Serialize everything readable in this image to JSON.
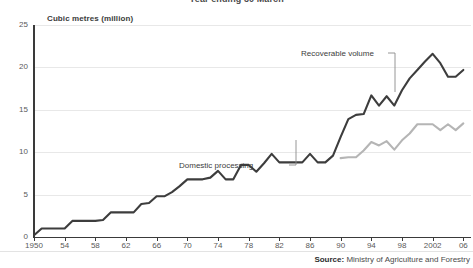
{
  "chart_data": {
    "type": "line",
    "title": "Year ending 30 March",
    "ylabel": "Cubic metres (million)",
    "xlabel": "",
    "ylim": [
      0,
      25
    ],
    "xlim": [
      1950,
      2007
    ],
    "yticks": [
      0,
      5,
      10,
      15,
      20,
      25
    ],
    "ytick_labels": [
      "0",
      "5",
      "10",
      "15",
      "20",
      "25"
    ],
    "xticks": [
      1950,
      1954,
      1958,
      1962,
      1966,
      1970,
      1974,
      1978,
      1982,
      1986,
      1990,
      1994,
      1998,
      2002,
      2006
    ],
    "xtick_labels": [
      "1950",
      "54",
      "58",
      "62",
      "66",
      "70",
      "74",
      "78",
      "82",
      "86",
      "90",
      "94",
      "98",
      "2002",
      "06"
    ],
    "grid": "horizontal",
    "legend_position": "inline-annotations",
    "series": [
      {
        "name": "Recoverable volume",
        "color": "#3d3d3d",
        "x": [
          1950,
          1951,
          1952,
          1953,
          1954,
          1955,
          1956,
          1957,
          1958,
          1959,
          1960,
          1961,
          1962,
          1963,
          1964,
          1965,
          1966,
          1967,
          1968,
          1969,
          1970,
          1971,
          1972,
          1973,
          1974,
          1975,
          1976,
          1977,
          1978,
          1979,
          1980,
          1981,
          1982,
          1983,
          1984,
          1985,
          1986,
          1987,
          1988,
          1989,
          1990,
          1991,
          1992,
          1993,
          1994,
          1995,
          1996,
          1997,
          1998,
          1999,
          2000,
          2001,
          2002,
          2003,
          2004,
          2005,
          2006
        ],
        "values": [
          0.2,
          1.0,
          1.0,
          1.0,
          1.0,
          1.9,
          1.9,
          1.9,
          1.9,
          2.0,
          2.9,
          2.9,
          2.9,
          2.9,
          3.9,
          4.0,
          4.8,
          4.8,
          5.3,
          6.0,
          6.8,
          6.8,
          6.8,
          7.0,
          7.8,
          6.8,
          6.8,
          8.5,
          8.5,
          7.7,
          8.7,
          9.8,
          8.8,
          8.8,
          8.8,
          8.8,
          9.8,
          8.8,
          8.8,
          9.6,
          11.8,
          13.9,
          14.4,
          14.5,
          16.7,
          15.5,
          16.6,
          15.5,
          17.3,
          18.7,
          19.7,
          20.7,
          21.6,
          20.5,
          18.9,
          18.9,
          19.7
        ]
      },
      {
        "name": "Domestic processing",
        "color": "#b5b5b5",
        "x": [
          1990,
          1991,
          1992,
          1993,
          1994,
          1995,
          1996,
          1997,
          1998,
          1999,
          2000,
          2001,
          2002,
          2003,
          2004,
          2005,
          2006
        ],
        "values": [
          9.3,
          9.4,
          9.4,
          10.2,
          11.2,
          10.8,
          11.3,
          10.3,
          11.4,
          12.2,
          13.3,
          13.3,
          13.3,
          12.6,
          13.3,
          12.6,
          13.4
        ]
      }
    ],
    "annotations": [
      {
        "label": "Recoverable volume",
        "series": "Recoverable volume"
      },
      {
        "label": "Domestic processing",
        "series": "Domestic processing"
      }
    ]
  },
  "source": {
    "prefix": "Source:",
    "text": " Ministry of Agriculture and Forestry"
  }
}
